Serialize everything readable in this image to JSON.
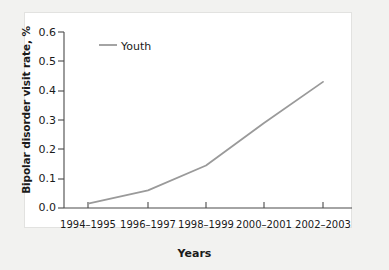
{
  "figure": {
    "background_color": "#f2f2f0",
    "panel_color": "#ffffff",
    "line_color": "#9a9a9a",
    "text_color": "#1a1a1a"
  },
  "chart_data": {
    "type": "line",
    "title": "",
    "xlabel": "Years",
    "ylabel": "Bipolar disorder visit rate, %",
    "categories": [
      "1994–1995",
      "1996–1997",
      "1998–1999",
      "2000–2001",
      "2002–2003"
    ],
    "series": [
      {
        "name": "Youth",
        "values": [
          0.015,
          0.06,
          0.145,
          0.29,
          0.43
        ],
        "color": "#9a9a9a"
      }
    ],
    "ylim": [
      0.0,
      0.6
    ],
    "ytick_labels": [
      "0.0",
      "0.1",
      "0.2",
      "0.3",
      "0.4",
      "0.5",
      "0.6"
    ],
    "ytick_values": [
      0.0,
      0.1,
      0.2,
      0.3,
      0.4,
      0.5,
      0.6
    ],
    "grid": false,
    "legend": {
      "position": "top-left-inside",
      "entries": [
        "Youth"
      ]
    }
  }
}
